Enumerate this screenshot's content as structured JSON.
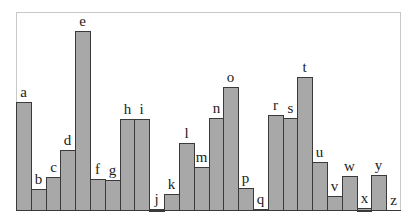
{
  "chart_data": {
    "type": "bar",
    "title": "",
    "xlabel": "",
    "ylabel": "",
    "categories": [
      "a",
      "b",
      "c",
      "d",
      "e",
      "f",
      "g",
      "h",
      "i",
      "j",
      "k",
      "l",
      "m",
      "n",
      "o",
      "p",
      "q",
      "r",
      "s",
      "t",
      "u",
      "v",
      "w",
      "x",
      "y",
      "z"
    ],
    "values": [
      108,
      21,
      33,
      60,
      179,
      31,
      30,
      91,
      91,
      1.5,
      16,
      67,
      43,
      92,
      123,
      22,
      1,
      95,
      92,
      133,
      48,
      14,
      34,
      2.5,
      35,
      0
    ],
    "ylim": [
      0,
      198
    ],
    "grid": false,
    "legend": null,
    "bar_labels_above": true,
    "colors": {
      "bar_fill": "#a8a8a8",
      "bar_edge": "#3a3a3a",
      "frame": "#c8c8c8"
    }
  }
}
